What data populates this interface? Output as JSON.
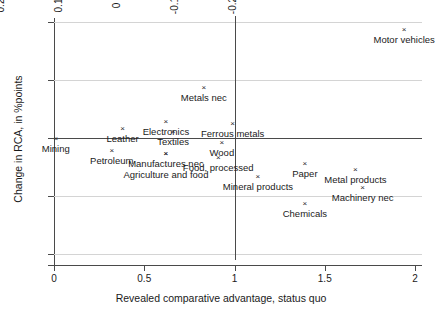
{
  "chart_data": {
    "type": "scatter",
    "title": "",
    "xlabel": "Revealed comparative advantage, status quo",
    "ylabel": "Change in RCA, in %points",
    "xlim": [
      0,
      2
    ],
    "ylim": [
      -0.2,
      0.2
    ],
    "xticks": [
      "0",
      "0.5",
      "1",
      "1.5",
      "2"
    ],
    "xtick_values": [
      0,
      0.5,
      1,
      1.5,
      2
    ],
    "yticks": [
      "0.2",
      "0.1",
      "0",
      "-0.1",
      "-0.2"
    ],
    "ytick_values": [
      0.2,
      0.1,
      0,
      -0.1,
      -0.2
    ],
    "grid": true,
    "legend": "none",
    "reference_lines": {
      "horizontal": 0,
      "vertical": 1
    },
    "marker_glyph": "×",
    "points": [
      {
        "label": "Motor vehicles",
        "x": 1.94,
        "y": 0.186,
        "label_pos": "below"
      },
      {
        "label": "Metals nec",
        "x": 0.83,
        "y": 0.087,
        "label_pos": "below"
      },
      {
        "label": "Electronics",
        "x": 0.62,
        "y": 0.028,
        "label_pos": "below"
      },
      {
        "label": "Leather",
        "x": 0.38,
        "y": 0.015,
        "label_pos": "below"
      },
      {
        "label": "Ferrous metals",
        "x": 0.99,
        "y": 0.024,
        "label_pos": "below"
      },
      {
        "label": "Textiles",
        "x": 0.66,
        "y": 0.01,
        "label_pos": "below"
      },
      {
        "label": "Wood",
        "x": 0.93,
        "y": -0.009,
        "label_pos": "below"
      },
      {
        "label": "Mining",
        "x": 0.01,
        "y": -0.001,
        "label_pos": "below"
      },
      {
        "label": "Petroleum",
        "x": 0.32,
        "y": -0.023,
        "label_pos": "below"
      },
      {
        "label": "Manufactures nec",
        "x": 0.62,
        "y": -0.027,
        "label_pos": "below"
      },
      {
        "label": "Agriculture and food",
        "x": 0.62,
        "y": -0.027,
        "label_pos": "below2"
      },
      {
        "label": "Food, processed",
        "x": 0.91,
        "y": -0.035,
        "label_pos": "below"
      },
      {
        "label": "Paper",
        "x": 1.39,
        "y": -0.045,
        "label_pos": "below"
      },
      {
        "label": "Metal products",
        "x": 1.67,
        "y": -0.055,
        "label_pos": "below"
      },
      {
        "label": "Mineral products",
        "x": 1.13,
        "y": -0.067,
        "label_pos": "below"
      },
      {
        "label": "Machinery nec",
        "x": 1.71,
        "y": -0.086,
        "label_pos": "below"
      },
      {
        "label": "Chemicals",
        "x": 1.39,
        "y": -0.114,
        "label_pos": "below"
      }
    ]
  }
}
